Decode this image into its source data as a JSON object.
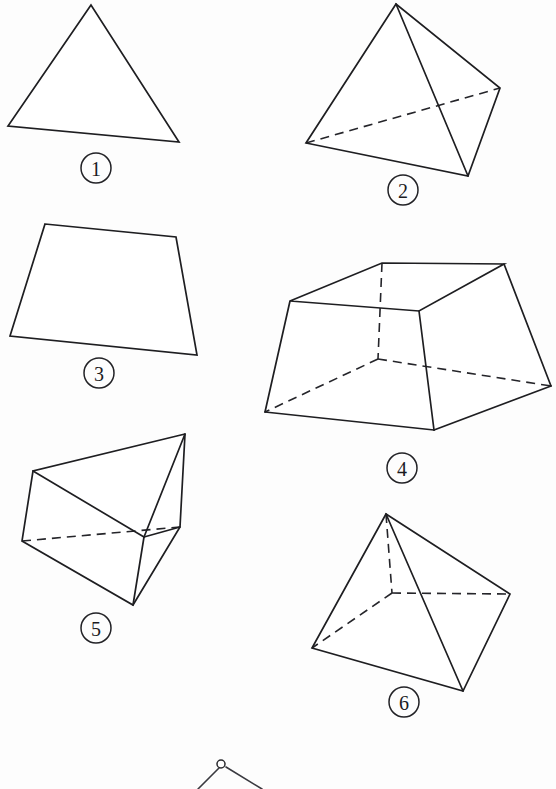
{
  "page": {
    "background_color": "#fdfdfd",
    "stroke_color": "#1e1e21",
    "hidden_stroke_color": "#25252a",
    "width": 556,
    "height": 789
  },
  "figures": [
    {
      "id": "figure-1",
      "label": "1",
      "name": "triangle",
      "label_center": {
        "x": 96,
        "y": 168
      },
      "visible_outline": [
        {
          "x": 91,
          "y": 5
        },
        {
          "x": 8,
          "y": 126
        },
        {
          "x": 179,
          "y": 142
        }
      ],
      "hidden_edges": []
    },
    {
      "id": "figure-2",
      "label": "2",
      "name": "tetrahedron",
      "label_center": {
        "x": 403,
        "y": 190
      },
      "visible_outline": [
        {
          "x": 396,
          "y": 4
        },
        {
          "x": 306,
          "y": 143
        },
        {
          "x": 468,
          "y": 176
        },
        {
          "x": 500,
          "y": 88
        }
      ],
      "visible_internal_edges": [
        [
          {
            "x": 396,
            "y": 4
          },
          {
            "x": 468,
            "y": 176
          }
        ]
      ],
      "hidden_edges": [
        [
          {
            "x": 306,
            "y": 143
          },
          {
            "x": 500,
            "y": 88
          }
        ]
      ]
    },
    {
      "id": "figure-3",
      "label": "3",
      "name": "trapezoid",
      "label_center": {
        "x": 99,
        "y": 373
      },
      "visible_outline": [
        {
          "x": 45,
          "y": 224
        },
        {
          "x": 176,
          "y": 237
        },
        {
          "x": 197,
          "y": 355
        },
        {
          "x": 10,
          "y": 336
        }
      ],
      "hidden_edges": []
    },
    {
      "id": "figure-4",
      "label": "4",
      "name": "square-frustum",
      "label_center": {
        "x": 402,
        "y": 468
      },
      "top_face": [
        {
          "x": 382,
          "y": 263
        },
        {
          "x": 504,
          "y": 264
        },
        {
          "x": 419,
          "y": 311
        },
        {
          "x": 290,
          "y": 301
        }
      ],
      "bottom_front_left": {
        "x": 265,
        "y": 412
      },
      "bottom_front_right": {
        "x": 434,
        "y": 430
      },
      "bottom_back_right": {
        "x": 551,
        "y": 386
      },
      "bottom_back_left": {
        "x": 378,
        "y": 359
      },
      "hidden_vertex": {
        "x": 378,
        "y": 359
      },
      "hidden_edges": [
        [
          {
            "x": 382,
            "y": 263
          },
          {
            "x": 378,
            "y": 359
          }
        ],
        [
          {
            "x": 378,
            "y": 359
          },
          {
            "x": 265,
            "y": 412
          }
        ],
        [
          {
            "x": 378,
            "y": 359
          },
          {
            "x": 551,
            "y": 386
          }
        ]
      ]
    },
    {
      "id": "figure-5",
      "label": "5",
      "name": "triangular-prism",
      "label_center": {
        "x": 96,
        "y": 628
      },
      "top_back": {
        "x": 185,
        "y": 434
      },
      "top_left": {
        "x": 33,
        "y": 471
      },
      "left_lower": {
        "x": 22,
        "y": 541
      },
      "bottom_front": {
        "x": 133,
        "y": 605
      },
      "right_mid": {
        "x": 180,
        "y": 527
      },
      "inner_vertex": {
        "x": 144,
        "y": 537
      },
      "hidden_edges": [
        [
          {
            "x": 22,
            "y": 541
          },
          {
            "x": 180,
            "y": 527
          }
        ]
      ]
    },
    {
      "id": "figure-6",
      "label": "6",
      "name": "square-pyramid",
      "label_center": {
        "x": 404,
        "y": 702
      },
      "apex": {
        "x": 386,
        "y": 514
      },
      "base_left": {
        "x": 312,
        "y": 648
      },
      "base_front": {
        "x": 463,
        "y": 691
      },
      "base_right": {
        "x": 510,
        "y": 594
      },
      "base_back_hidden": {
        "x": 392,
        "y": 593
      },
      "hidden_edges": [
        [
          {
            "x": 386,
            "y": 514
          },
          {
            "x": 392,
            "y": 593
          }
        ],
        [
          {
            "x": 392,
            "y": 593
          },
          {
            "x": 312,
            "y": 648
          }
        ],
        [
          {
            "x": 392,
            "y": 593
          },
          {
            "x": 510,
            "y": 594
          }
        ]
      ]
    },
    {
      "id": "figure-7-partial",
      "label": "",
      "name": "partial-figure-cut-off",
      "apex_marker": {
        "x": 221,
        "y": 764
      },
      "edges": [
        [
          {
            "x": 221,
            "y": 767
          },
          {
            "x": 200,
            "y": 789
          }
        ],
        [
          {
            "x": 224,
            "y": 766
          },
          {
            "x": 261,
            "y": 789
          }
        ]
      ]
    }
  ]
}
